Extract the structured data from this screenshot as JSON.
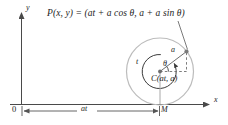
{
  "figure": {
    "equation": {
      "point_label": "P(x, y)",
      "equals": "=",
      "expression": "(at + a cos θ, a + a sin θ)",
      "full": "P(x, y) = (at + a cos θ, a + a sin θ)"
    },
    "axes": {
      "x_label": "x",
      "y_label": "y",
      "origin_label": "0"
    },
    "labels": {
      "center": "C(at, a)",
      "radius": "a",
      "arc_param": "t",
      "angle": "θ",
      "contact_point": "M",
      "distance": "at"
    },
    "colors": {
      "rolling_circle": "#b9b9b9",
      "inner_arc": "#3a3a3a",
      "axis": "#4a4a4a",
      "text": "#1c1c1c",
      "point_marker": "#6e6e6e"
    }
  }
}
